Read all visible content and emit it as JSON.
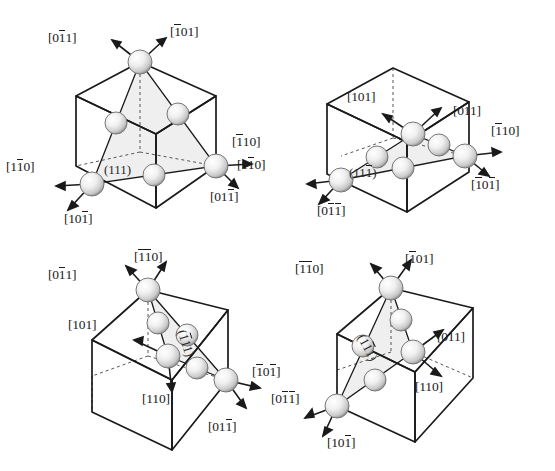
{
  "figure": {
    "type": "crystallography-diagram",
    "background_color": "#ffffff",
    "line_color": "#1a1a1a",
    "plane_fill_color": "#ececec",
    "atom_color": "#e8e8e8",
    "atom_shade_color": "#9a9a9a"
  },
  "panels": [
    {
      "id": "panel-1",
      "plane": {
        "label": "(111)",
        "indices": [
          "1",
          "1",
          "1"
        ],
        "bars": [
          false,
          false,
          false
        ]
      },
      "directions": [
        {
          "label": "[011]",
          "bars": [
            false,
            true,
            false
          ],
          "position": "top-left"
        },
        {
          "label": "[101]",
          "bars": [
            true,
            false,
            false
          ],
          "position": "top-right"
        },
        {
          "label": "[110]",
          "bars": [
            true,
            false,
            false
          ],
          "position": "right-upper"
        },
        {
          "label": "[011]",
          "bars": [
            false,
            false,
            true
          ],
          "position": "right-lower"
        },
        {
          "label": "[110]",
          "bars": [
            false,
            true,
            false
          ],
          "position": "left-lower"
        },
        {
          "label": "[101]",
          "bars": [
            false,
            false,
            true
          ],
          "position": "bottom-left"
        }
      ]
    },
    {
      "id": "panel-2",
      "plane": {
        "label": "(111)",
        "indices": [
          "1",
          "1",
          "1"
        ],
        "bars": [
          false,
          false,
          true
        ]
      },
      "directions": [
        {
          "label": "[101]",
          "bars": [
            false,
            false,
            false
          ],
          "position": "top-left"
        },
        {
          "label": "[011]",
          "bars": [
            false,
            false,
            false
          ],
          "position": "top-right"
        },
        {
          "label": "[110]",
          "bars": [
            true,
            false,
            false
          ],
          "position": "right-upper"
        },
        {
          "label": "[101]",
          "bars": [
            true,
            false,
            true
          ],
          "position": "right-lower"
        },
        {
          "label": "[110]",
          "bars": [
            false,
            true,
            false
          ],
          "position": "left-lower"
        },
        {
          "label": "[011]",
          "bars": [
            false,
            true,
            true
          ],
          "position": "bottom-left"
        }
      ]
    },
    {
      "id": "panel-3",
      "plane": {
        "label": "(111)",
        "indices": [
          "1",
          "1",
          "1"
        ],
        "bars": [
          true,
          false,
          false
        ]
      },
      "directions": [
        {
          "label": "[011]",
          "bars": [
            false,
            true,
            false
          ],
          "position": "top-left"
        },
        {
          "label": "[110]",
          "bars": [
            true,
            true,
            false
          ],
          "position": "top-right"
        },
        {
          "label": "[101]",
          "bars": [
            false,
            false,
            false
          ],
          "position": "left-upper"
        },
        {
          "label": "[110]",
          "bars": [
            false,
            false,
            false
          ],
          "position": "center-lower"
        },
        {
          "label": "[101]",
          "bars": [
            true,
            false,
            true
          ],
          "position": "right-lower"
        },
        {
          "label": "[011]",
          "bars": [
            false,
            false,
            true
          ],
          "position": "bottom-right"
        }
      ]
    },
    {
      "id": "panel-4",
      "plane": {
        "label": "(111)",
        "indices": [
          "1",
          "1",
          "1"
        ],
        "bars": [
          false,
          true,
          false
        ]
      },
      "directions": [
        {
          "label": "[110]",
          "bars": [
            true,
            true,
            false
          ],
          "position": "top-left"
        },
        {
          "label": "[101]",
          "bars": [
            true,
            false,
            false
          ],
          "position": "top-right"
        },
        {
          "label": "[011]",
          "bars": [
            false,
            false,
            false
          ],
          "position": "right-upper"
        },
        {
          "label": "[110]",
          "bars": [
            false,
            false,
            false
          ],
          "position": "right-lower"
        },
        {
          "label": "[011]",
          "bars": [
            false,
            true,
            true
          ],
          "position": "left-lower"
        },
        {
          "label": "[101]",
          "bars": [
            false,
            false,
            true
          ],
          "position": "bottom-left"
        }
      ]
    }
  ]
}
